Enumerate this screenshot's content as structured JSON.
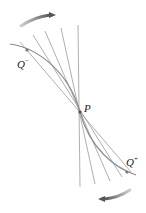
{
  "labels": {
    "P": "P",
    "Q_minus": "Q",
    "Q_minus_sup": "−",
    "Q_plus": "Q",
    "Q_plus_sup": "+"
  },
  "colors": {
    "lines": "#9a9a9a",
    "curve": "#8c8c8c",
    "arrow": "#6a6a6a",
    "background": "#ffffff"
  },
  "diagram": {
    "point_P": [
      80,
      112
    ],
    "point_Q_minus": [
      27,
      50
    ],
    "point_Q_plus": [
      127,
      172
    ],
    "secant_count": 5
  }
}
